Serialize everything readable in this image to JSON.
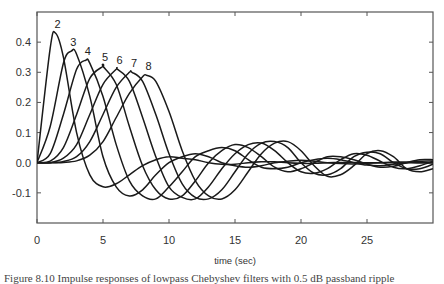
{
  "chart_data": {
    "type": "line",
    "title": "",
    "xlabel": "time   (sec)",
    "ylabel": "",
    "xlim": [
      0,
      30
    ],
    "ylim": [
      -0.2,
      0.5
    ],
    "grid": false,
    "legend": "inline labels at curve peaks",
    "x_ticks": [
      0,
      5,
      10,
      15,
      20,
      25
    ],
    "x_tick_labels": [
      "0",
      "5",
      "10",
      "15",
      "20",
      "25"
    ],
    "y_ticks": [
      -0.1,
      0.0,
      0.1,
      0.2,
      0.3,
      0.4
    ],
    "y_tick_labels": [
      "-0.1",
      "0.0",
      "0.1",
      "0.2",
      "0.3",
      "0.4"
    ],
    "x": [
      0,
      1,
      2,
      3,
      4,
      5,
      6,
      7,
      8,
      9,
      10,
      11,
      12,
      13,
      14,
      15,
      16,
      17,
      18,
      19,
      20,
      21,
      22,
      23,
      24,
      25,
      26,
      27,
      28,
      29,
      30
    ],
    "series": [
      {
        "name": "2",
        "peak": [
          1.4,
          0.43
        ],
        "values": [
          0.0,
          0.38,
          0.35,
          0.1,
          -0.04,
          -0.08,
          -0.07,
          -0.04,
          -0.01,
          0.01,
          0.02,
          0.015,
          0.01,
          0.0,
          -0.005,
          -0.005,
          0.0,
          0.003,
          0.003,
          0.0,
          -0.002,
          -0.002,
          0.0,
          0.001,
          0.001,
          0.0,
          0.0,
          0.0,
          0.0,
          0.0,
          0.0
        ]
      },
      {
        "name": "3",
        "peak": [
          2.6,
          0.37
        ],
        "values": [
          0.0,
          0.12,
          0.33,
          0.36,
          0.22,
          0.02,
          -0.08,
          -0.11,
          -0.09,
          -0.04,
          0.0,
          0.02,
          0.03,
          0.02,
          0.0,
          -0.01,
          -0.015,
          -0.01,
          0.0,
          0.005,
          0.008,
          0.005,
          0.0,
          -0.003,
          -0.004,
          -0.002,
          0.0,
          0.002,
          0.002,
          0.0,
          0.0
        ]
      },
      {
        "name": "4",
        "peak": [
          3.7,
          0.34
        ],
        "values": [
          0.0,
          0.03,
          0.16,
          0.31,
          0.33,
          0.22,
          0.06,
          -0.06,
          -0.11,
          -0.12,
          -0.08,
          -0.03,
          0.02,
          0.04,
          0.05,
          0.04,
          0.01,
          -0.015,
          -0.02,
          -0.015,
          0.0,
          0.01,
          0.015,
          0.01,
          0.0,
          -0.008,
          -0.01,
          -0.005,
          0.0,
          0.005,
          0.006
        ]
      },
      {
        "name": "5",
        "peak": [
          5.0,
          0.32
        ],
        "values": [
          0.0,
          0.005,
          0.05,
          0.16,
          0.28,
          0.32,
          0.26,
          0.12,
          -0.01,
          -0.09,
          -0.12,
          -0.11,
          -0.06,
          0.0,
          0.04,
          0.06,
          0.05,
          0.02,
          -0.015,
          -0.03,
          -0.02,
          0.0,
          0.02,
          0.02,
          0.01,
          -0.005,
          -0.015,
          -0.012,
          0.0,
          0.01,
          0.01
        ]
      },
      {
        "name": "6",
        "peak": [
          6.1,
          0.31
        ],
        "values": [
          0.0,
          0.0,
          0.015,
          0.06,
          0.16,
          0.26,
          0.31,
          0.27,
          0.15,
          0.02,
          -0.08,
          -0.115,
          -0.12,
          -0.08,
          -0.02,
          0.03,
          0.06,
          0.065,
          0.04,
          0.0,
          -0.03,
          -0.035,
          -0.02,
          0.01,
          0.03,
          0.025,
          0.005,
          -0.015,
          -0.02,
          -0.01,
          0.005
        ]
      },
      {
        "name": "7",
        "peak": [
          7.2,
          0.3
        ],
        "values": [
          0.0,
          0.0,
          0.004,
          0.02,
          0.07,
          0.16,
          0.25,
          0.3,
          0.27,
          0.16,
          0.03,
          -0.07,
          -0.115,
          -0.12,
          -0.09,
          -0.03,
          0.03,
          0.065,
          0.07,
          0.05,
          0.0,
          -0.035,
          -0.04,
          -0.02,
          0.02,
          0.035,
          0.03,
          0.0,
          -0.02,
          -0.02,
          -0.005
        ]
      },
      {
        "name": "8",
        "peak": [
          8.3,
          0.29
        ],
        "values": [
          0.0,
          0.0,
          0.001,
          0.006,
          0.025,
          0.07,
          0.15,
          0.23,
          0.285,
          0.27,
          0.17,
          0.04,
          -0.06,
          -0.11,
          -0.12,
          -0.09,
          -0.03,
          0.03,
          0.065,
          0.07,
          0.04,
          -0.01,
          -0.045,
          -0.04,
          -0.01,
          0.03,
          0.04,
          0.02,
          -0.02,
          -0.03,
          -0.02
        ]
      }
    ]
  },
  "labels": {
    "x_axis_title": "time   (sec)",
    "caption": "Figure 8.10  Impulse responses of lowpass Chebyshev filters with 0.5 dB passband ripple"
  },
  "style": {
    "line_color": "#1a1a1a",
    "axis_color": "#555555",
    "background": "#ffffff"
  }
}
